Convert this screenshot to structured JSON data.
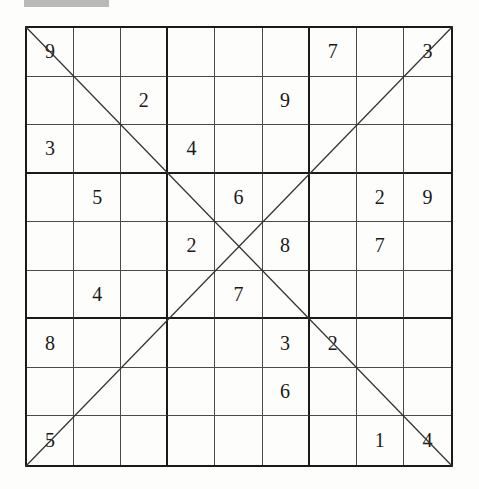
{
  "puzzle": {
    "type": "diagonal-sudoku",
    "size": 9,
    "rows": [
      [
        "9",
        "",
        "",
        "",
        "",
        "",
        "7",
        "",
        "3"
      ],
      [
        "",
        "",
        "2",
        "",
        "",
        "9",
        "",
        "",
        ""
      ],
      [
        "3",
        "",
        "",
        "4",
        "",
        "",
        "",
        "",
        ""
      ],
      [
        "",
        "5",
        "",
        "",
        "6",
        "",
        "",
        "2",
        "9"
      ],
      [
        "",
        "",
        "",
        "2",
        "",
        "8",
        "",
        "7",
        ""
      ],
      [
        "",
        "4",
        "",
        "",
        "7",
        "",
        "",
        "",
        ""
      ],
      [
        "8",
        "",
        "",
        "",
        "",
        "3",
        "2",
        "",
        ""
      ],
      [
        "",
        "",
        "",
        "",
        "",
        "6",
        "",
        "",
        ""
      ],
      [
        "5",
        "",
        "",
        "",
        "",
        "",
        "",
        "1",
        "4"
      ]
    ],
    "diagonals": [
      "top-left-to-bottom-right",
      "top-right-to-bottom-left"
    ]
  },
  "colors": {
    "background": "#fdfdfc",
    "grid_line": "#1a1a1a",
    "thin_line": "#4a4a4a",
    "header_bar": "#b9b9b9"
  }
}
